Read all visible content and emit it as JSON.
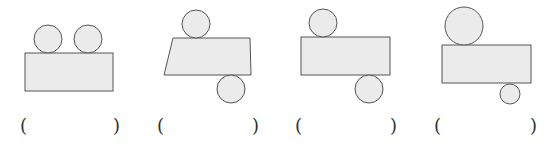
{
  "figures": [
    {
      "id": "fig-1",
      "shape": "rectangle-with-two-circles-on-top",
      "circles": [
        {
          "cx": 48,
          "cy": 39,
          "r": 14
        },
        {
          "cx": 88,
          "cy": 39,
          "r": 14
        }
      ],
      "body": {
        "type": "rect",
        "points": [
          [
            25,
            53
          ],
          [
            113,
            53
          ],
          [
            113,
            91
          ],
          [
            25,
            91
          ]
        ]
      },
      "answer": {
        "open": "(",
        "blank": "",
        "close": ")",
        "open_x": 20,
        "close_x": 113
      }
    },
    {
      "id": "fig-2",
      "shape": "trapezoid-with-circle-top-and-bottom",
      "circles": [
        {
          "cx": 196,
          "cy": 24,
          "r": 14
        },
        {
          "cx": 231,
          "cy": 89,
          "r": 14
        }
      ],
      "body": {
        "type": "trapezoid",
        "points": [
          [
            173,
            38
          ],
          [
            250,
            38
          ],
          [
            251,
            75
          ],
          [
            164,
            75
          ]
        ]
      },
      "answer": {
        "open": "(",
        "blank": "",
        "close": ")",
        "open_x": 157,
        "close_x": 252
      }
    },
    {
      "id": "fig-3",
      "shape": "rectangle-with-circle-top-and-bottom",
      "circles": [
        {
          "cx": 323,
          "cy": 23,
          "r": 14
        },
        {
          "cx": 369,
          "cy": 89,
          "r": 14
        }
      ],
      "body": {
        "type": "rect",
        "points": [
          [
            301,
            37
          ],
          [
            390,
            37
          ],
          [
            390,
            75
          ],
          [
            301,
            75
          ]
        ]
      },
      "answer": {
        "open": "(",
        "blank": "",
        "close": ")",
        "open_x": 295,
        "close_x": 390
      }
    },
    {
      "id": "fig-4",
      "shape": "rectangle-with-large-top-circle-small-bottom-circle",
      "circles": [
        {
          "cx": 464,
          "cy": 26,
          "r": 19
        },
        {
          "cx": 510,
          "cy": 94,
          "r": 10
        }
      ],
      "body": {
        "type": "rect",
        "points": [
          [
            442,
            45
          ],
          [
            531,
            45
          ],
          [
            531,
            83
          ],
          [
            442,
            83
          ]
        ]
      },
      "answer": {
        "open": "(",
        "blank": "",
        "close": ")",
        "open_x": 434,
        "close_x": 530
      }
    }
  ],
  "colors": {
    "fill": "#ebebeb",
    "stroke": "#555555",
    "text": "#333333"
  }
}
